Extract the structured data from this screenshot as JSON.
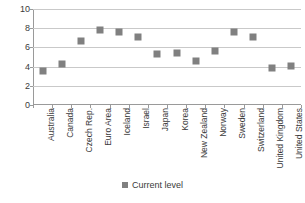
{
  "chart_data": {
    "type": "scatter",
    "title": "",
    "subtitle": "",
    "xlabel": "",
    "ylabel": "",
    "ylim": [
      0,
      10
    ],
    "yticks": [
      0,
      2,
      4,
      6,
      8,
      10
    ],
    "grid": true,
    "legend_position": "bottom",
    "marker_color": "#808080",
    "marker_shape": "square",
    "categories": [
      "Australia",
      "Canada",
      "Czech Rep.",
      "Euro Area",
      "Iceland",
      "Israel",
      "Japan",
      "Korea",
      "New Zealand",
      "Norway",
      "Sweden",
      "Switzerland",
      "United Kingdom",
      "United States"
    ],
    "series": [
      {
        "name": "Current level",
        "values": [
          3.5,
          4.3,
          6.7,
          7.8,
          7.6,
          7.1,
          5.3,
          5.4,
          4.6,
          5.6,
          7.6,
          7.1,
          3.9,
          4.1
        ]
      }
    ]
  },
  "legend": {
    "entries": [
      {
        "label": "Current level",
        "color": "#808080"
      }
    ]
  },
  "axis": {
    "y_tick_labels": [
      "0",
      "2",
      "4",
      "6",
      "8",
      "10"
    ]
  }
}
